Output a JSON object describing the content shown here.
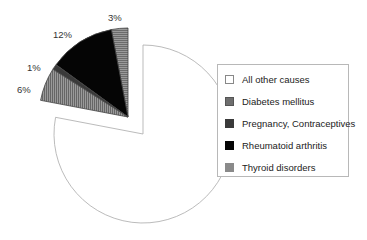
{
  "chart_data": {
    "type": "pie",
    "title": "",
    "slices": [
      {
        "label": "Thyroid disorders",
        "value": 3,
        "display": "3%",
        "color": "#8a8a8a",
        "pattern": "horizontal-hatch",
        "exploded": true
      },
      {
        "label": "Rheumatoid arthritis",
        "value": 12,
        "display": "12%",
        "color": "#050505",
        "pattern": "solid",
        "exploded": true
      },
      {
        "label": "Pregnancy, Contraceptives",
        "value": 1,
        "display": "1%",
        "color": "#3a3a3a",
        "pattern": "solid",
        "exploded": true
      },
      {
        "label": "Diabetes mellitus",
        "value": 6,
        "display": "6%",
        "color": "#7a7a7a",
        "pattern": "vertical-hatch",
        "exploded": true
      },
      {
        "label": "All other causes",
        "value": 78,
        "display": "",
        "color": "#ffffff",
        "pattern": "none",
        "exploded": false
      }
    ],
    "legend": {
      "position": "right",
      "entries": [
        "All other causes",
        "Diabetes mellitus",
        "Pregnancy, Contraceptives",
        "Rheumatoid arthritis",
        "Thyroid disorders"
      ]
    }
  },
  "labels": {
    "thyroid": "3%",
    "ra": "12%",
    "pregnancy": "1%",
    "diabetes": "6%"
  },
  "legend": {
    "items": [
      {
        "label": "All other causes",
        "color": "#ffffff"
      },
      {
        "label": "Diabetes mellitus",
        "color": "#6e6e6e"
      },
      {
        "label": "Pregnancy, Contraceptives",
        "color": "#3a3a3a"
      },
      {
        "label": "Rheumatoid arthritis",
        "color": "#050505"
      },
      {
        "label": "Thyroid disorders",
        "color": "#8a8a8a"
      }
    ]
  }
}
